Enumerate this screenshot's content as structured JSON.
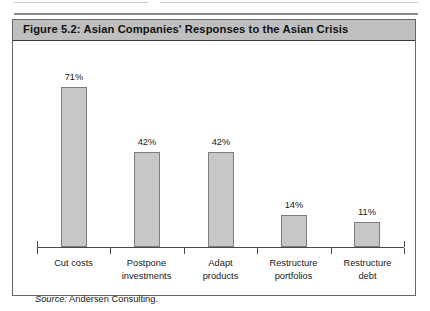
{
  "figure": {
    "title": "Figure 5.2:  Asian Companies' Responses to the Asian Crisis",
    "source_lead": "Source:",
    "source_text": " Andersen Consulting."
  },
  "chart_data": {
    "type": "bar",
    "title": "Figure 5.2:  Asian Companies' Responses to the Asian Crisis",
    "categories": [
      "Cut costs",
      "Postpone investments",
      "Adapt products",
      "Restructure portfolios",
      "Restructure debt"
    ],
    "category_lines": [
      [
        "Cut costs"
      ],
      [
        "Postpone",
        "investments"
      ],
      [
        "Adapt",
        "products"
      ],
      [
        "Restructure",
        "portfolios"
      ],
      [
        "Restructure",
        "debt"
      ]
    ],
    "values": [
      71,
      42,
      42,
      14,
      11
    ],
    "value_labels": [
      "71%",
      "42%",
      "42%",
      "14%",
      "11%"
    ],
    "xlabel": "",
    "ylabel": "",
    "ylim": [
      0,
      80
    ],
    "unit": "%",
    "grid": false,
    "legend": false,
    "bar_color": "#c7c7c7",
    "bar_border_color": "#7d7d7d",
    "axis_color": "#4a4a4a",
    "source": "Source: Andersen Consulting."
  }
}
